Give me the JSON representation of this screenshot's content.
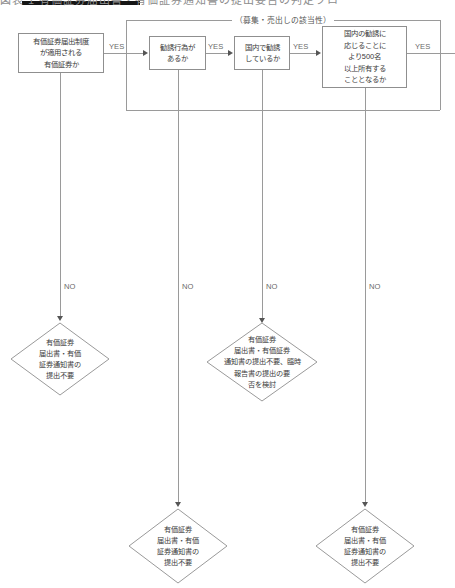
{
  "page": {
    "header_fragment": "図表 1 有価証券届出書・有価証券通知書の提出要否の判定フロー",
    "bracket_label": "（募集・売出しの該当性）"
  },
  "labels": {
    "yes": "YES",
    "no": "NO"
  },
  "decisions": [
    {
      "id": "d1",
      "lines": [
        "有価証券届出制度",
        "が適用される",
        "有価証券か"
      ]
    },
    {
      "id": "d2",
      "lines": [
        "勧誘行為が",
        "あるか"
      ]
    },
    {
      "id": "d3",
      "lines": [
        "国内で勧誘",
        "しているか"
      ]
    },
    {
      "id": "d4",
      "lines": [
        "国内の勧誘に",
        "応じることに",
        "より500名",
        "以上所有する",
        "こととなるか"
      ]
    }
  ],
  "outcomes": [
    {
      "id": "o1",
      "lines": [
        "有価証券",
        "届出書・有価",
        "証券通知書の",
        "提出不要"
      ]
    },
    {
      "id": "o2",
      "lines": [
        "有価証券",
        "届出書・有価",
        "証券通知書の",
        "提出不要"
      ]
    },
    {
      "id": "o3",
      "lines": [
        "有価証券",
        "届出書・有価証券",
        "通知書の提出不要、臨時",
        "報告書の提出の要",
        "否を検討"
      ]
    },
    {
      "id": "o4",
      "lines": [
        "有価証券",
        "届出書・有価",
        "証券通知書の",
        "提出不要"
      ]
    }
  ],
  "yes_edges": [
    "YES",
    "YES",
    "YES",
    "YES"
  ],
  "no_edges": [
    "NO",
    "NO",
    "NO",
    "NO"
  ],
  "colors": {
    "line": "#9a9a9a",
    "text": "#3a3a3a",
    "label": "#6a6a6a",
    "background": "#ffffff"
  }
}
